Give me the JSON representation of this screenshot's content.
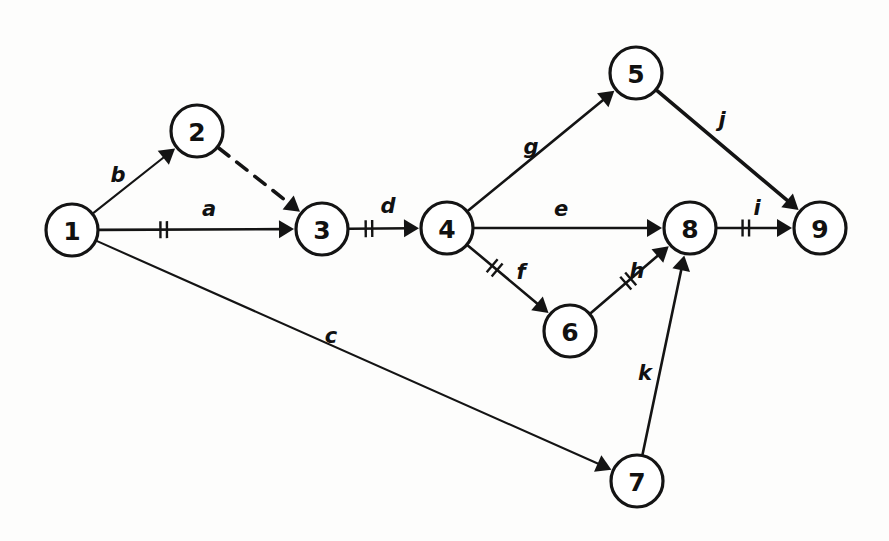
{
  "diagram": {
    "kind": "directed-network",
    "background_color": "#fdfdfc",
    "ink_color": "#141414",
    "node_radius": 26,
    "nodes": [
      {
        "id": "1",
        "label": "1",
        "x": 72,
        "y": 230
      },
      {
        "id": "2",
        "label": "2",
        "x": 197,
        "y": 131
      },
      {
        "id": "3",
        "label": "3",
        "x": 322,
        "y": 229
      },
      {
        "id": "4",
        "label": "4",
        "x": 447,
        "y": 228
      },
      {
        "id": "5",
        "label": "5",
        "x": 636,
        "y": 73
      },
      {
        "id": "6",
        "label": "6",
        "x": 570,
        "y": 331
      },
      {
        "id": "7",
        "label": "7",
        "x": 637,
        "y": 481
      },
      {
        "id": "8",
        "label": "8",
        "x": 690,
        "y": 228
      },
      {
        "id": "9",
        "label": "9",
        "x": 820,
        "y": 228
      }
    ],
    "edges": [
      {
        "id": "e-b",
        "label": "b",
        "from": "1",
        "to": "2",
        "style": "solid",
        "weight": "thin",
        "ticks": 0,
        "label_x": 118,
        "label_y": 175
      },
      {
        "id": "e-dummy",
        "label": "",
        "from": "2",
        "to": "3",
        "style": "dashed",
        "weight": "thick",
        "ticks": 0,
        "label_x": 0,
        "label_y": 0
      },
      {
        "id": "e-a",
        "label": "a",
        "from": "1",
        "to": "3",
        "style": "solid",
        "weight": "normal",
        "ticks": 2,
        "tick_t": 0.33,
        "label_x": 209,
        "label_y": 209
      },
      {
        "id": "e-d",
        "label": "d",
        "from": "3",
        "to": "4",
        "style": "solid",
        "weight": "normal",
        "ticks": 2,
        "tick_t": 0.28,
        "label_x": 388,
        "label_y": 206
      },
      {
        "id": "e-g",
        "label": "g",
        "from": "4",
        "to": "5",
        "style": "solid",
        "weight": "normal",
        "ticks": 0,
        "label_x": 531,
        "label_y": 147
      },
      {
        "id": "e-e",
        "label": "e",
        "from": "4",
        "to": "8",
        "style": "solid",
        "weight": "normal",
        "ticks": 0,
        "label_x": 561,
        "label_y": 209
      },
      {
        "id": "e-f",
        "label": "f",
        "from": "4",
        "to": "6",
        "style": "solid",
        "weight": "normal",
        "ticks": 2,
        "tick_t": 0.33,
        "label_x": 521,
        "label_y": 272
      },
      {
        "id": "e-h",
        "label": "h",
        "from": "6",
        "to": "8",
        "style": "solid",
        "weight": "normal",
        "ticks": 2,
        "tick_t": 0.48,
        "label_x": 637,
        "label_y": 271
      },
      {
        "id": "e-j",
        "label": "j",
        "from": "5",
        "to": "9",
        "style": "solid",
        "weight": "thick",
        "ticks": 0,
        "label_x": 722,
        "label_y": 120
      },
      {
        "id": "e-i",
        "label": "i",
        "from": "8",
        "to": "9",
        "style": "solid",
        "weight": "normal",
        "ticks": 2,
        "tick_t": 0.38,
        "label_x": 757,
        "label_y": 208
      },
      {
        "id": "e-c",
        "label": "c",
        "from": "1",
        "to": "7",
        "style": "solid",
        "weight": "thin",
        "ticks": 0,
        "label_x": 331,
        "label_y": 336
      },
      {
        "id": "e-k",
        "label": "k",
        "from": "7",
        "to": "8",
        "style": "solid",
        "weight": "normal",
        "ticks": 0,
        "label_x": 645,
        "label_y": 373
      }
    ]
  }
}
